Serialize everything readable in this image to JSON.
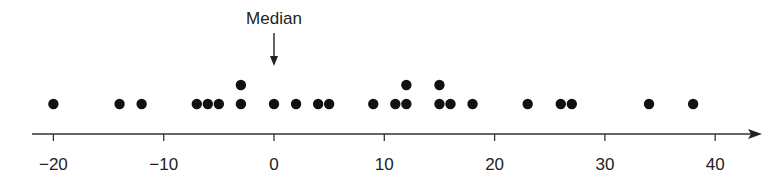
{
  "chart_data": {
    "type": "scatter",
    "subtype": "dot_plot",
    "title": "",
    "xlabel": "",
    "ylabel": "",
    "xlim": [
      -22,
      44
    ],
    "xticks": [
      -20,
      -10,
      0,
      10,
      20,
      30,
      40
    ],
    "xtick_labels": [
      "−20",
      "−10",
      "0",
      "10",
      "20",
      "30",
      "40"
    ],
    "grid": false,
    "legend": null,
    "values": [
      -20,
      -14,
      -12,
      -7,
      -6,
      -5,
      -3,
      -3,
      0,
      2,
      4,
      5,
      9,
      11,
      12,
      12,
      15,
      15,
      16,
      18,
      23,
      26,
      27,
      34,
      38
    ],
    "annotations": [
      {
        "text": "Median",
        "x": 0,
        "arrow": "down"
      }
    ],
    "colors": {
      "dot": "#111111",
      "axis": "#333333",
      "text": "#222222"
    }
  },
  "annotation": {
    "median_label": "Median"
  }
}
